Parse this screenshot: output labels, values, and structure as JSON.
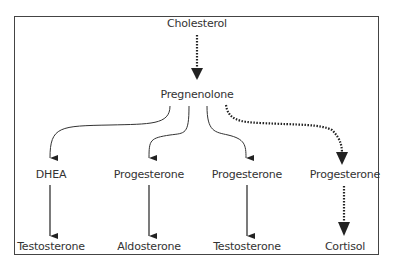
{
  "diagram": {
    "nodes": {
      "cholesterol": "Cholesterol",
      "pregnenolone": "Pregnenolone",
      "dhea": "DHEA",
      "progesterone_1": "Progesterone",
      "progesterone_2": "Progesterone",
      "progesterone_3": "Progesterone",
      "testosterone_1": "Testosterone",
      "aldosterone": "Aldosterone",
      "testosterone_2": "Testosterone",
      "cortisol": "Cortisol"
    },
    "edges": [
      {
        "from": "Cholesterol",
        "to": "Pregnenolone",
        "style": "dotted"
      },
      {
        "from": "Pregnenolone",
        "to": "DHEA",
        "style": "solid"
      },
      {
        "from": "Pregnenolone",
        "to": "Progesterone (1)",
        "style": "solid"
      },
      {
        "from": "Pregnenolone",
        "to": "Progesterone (2)",
        "style": "solid"
      },
      {
        "from": "Pregnenolone",
        "to": "Progesterone (3)",
        "style": "dotted"
      },
      {
        "from": "DHEA",
        "to": "Testosterone",
        "style": "solid"
      },
      {
        "from": "Progesterone (1)",
        "to": "Aldosterone",
        "style": "solid"
      },
      {
        "from": "Progesterone (2)",
        "to": "Testosterone",
        "style": "solid"
      },
      {
        "from": "Progesterone (3)",
        "to": "Cortisol",
        "style": "dotted"
      }
    ]
  }
}
